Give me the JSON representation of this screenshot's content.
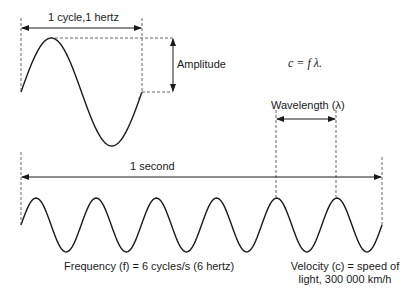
{
  "labels": {
    "cycle": "1 cycle,1 hertz",
    "amplitude": "Amplitude",
    "formula": "c = f λ.",
    "wavelength": "Wavelength (λ)",
    "second": "1 second",
    "frequency": "Frequency (f) = 6 cycles/s (6 hertz)",
    "velocity_line1": "Velocity (c) = speed of",
    "velocity_line2": "light, 300 000 km/h"
  },
  "waves": {
    "large": {
      "cycles": 1,
      "x_start": 21,
      "x_end": 142,
      "midline_y": 92,
      "amplitude": 54
    },
    "small": {
      "cycles": 6,
      "x_start": 21,
      "x_end": 382,
      "midline_y": 225,
      "amplitude": 27
    }
  },
  "colors": {
    "stroke": "#1a1a1a",
    "dash": "#555555",
    "background": "#ffffff"
  }
}
